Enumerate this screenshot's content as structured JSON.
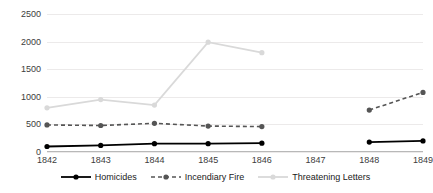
{
  "chart_data": {
    "type": "line",
    "title": "",
    "subtitle": "",
    "xlabel": "",
    "ylabel": "",
    "categories": [
      "1842",
      "1843",
      "1844",
      "1845",
      "1846",
      "1847",
      "1848",
      "1849"
    ],
    "x": [
      1842,
      1843,
      1844,
      1845,
      1846,
      1847,
      1848,
      1849
    ],
    "ylim": [
      0,
      2500
    ],
    "yticks": [
      0,
      500,
      1000,
      1500,
      2000,
      2500
    ],
    "ytick_labels": [
      "0",
      "500",
      "1000",
      "1500",
      "2000",
      "2500"
    ],
    "grid": true,
    "legend_position": "bottom",
    "series": [
      {
        "name": "Homicides",
        "color": "#000000",
        "style": "solid",
        "marker": "circle",
        "values": [
          100,
          120,
          150,
          150,
          160,
          null,
          180,
          200
        ]
      },
      {
        "name": "Incendiary Fire",
        "color": "#555555",
        "style": "dashed",
        "marker": "circle",
        "values": [
          490,
          480,
          520,
          470,
          460,
          null,
          760,
          1080
        ]
      },
      {
        "name": "Threatening Letters",
        "color": "#d9d9d9",
        "style": "solid",
        "marker": "circle",
        "values": [
          800,
          950,
          850,
          1990,
          1800,
          null,
          null,
          null
        ]
      }
    ]
  },
  "legend": {
    "items": [
      {
        "label": "Homicides",
        "swatch": "line-solid-black-icon"
      },
      {
        "label": "Incendiary Fire",
        "swatch": "line-dashed-gray-icon"
      },
      {
        "label": "Threatening Letters",
        "swatch": "line-solid-lightgray-icon"
      }
    ]
  },
  "colors": {
    "homicides": "#000000",
    "incendiary_fire": "#555555",
    "threatening_letters": "#d9d9d9",
    "gridline": "#eceaea",
    "axis": "#b8b8b8",
    "text": "#3c3c3c",
    "background": "#ffffff"
  }
}
